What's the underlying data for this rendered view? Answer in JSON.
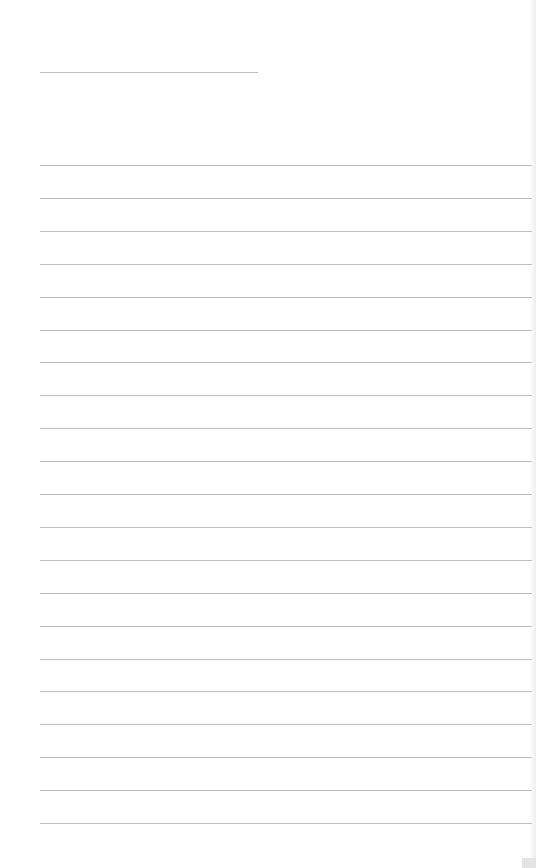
{
  "page": {
    "type": "lined-paper",
    "title_line": {
      "top": 72,
      "left": 40,
      "width": 218
    },
    "ruled_lines": {
      "count": 21,
      "first_top": 165,
      "spacing": 32.9,
      "left": 40,
      "width": 492
    },
    "line_color": "#bdbdbd",
    "background": "#fefefe",
    "text": []
  }
}
